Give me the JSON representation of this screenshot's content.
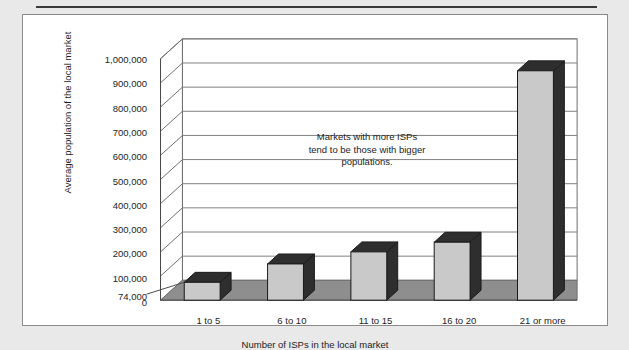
{
  "chart_data": {
    "type": "bar",
    "title": "",
    "xlabel": "Number of ISPs in the local market",
    "ylabel": "Average population of the local market",
    "categories": [
      "1 to 5",
      "6 to 10",
      "11 to 15",
      "16 to 20",
      "21 or more"
    ],
    "values": [
      74000,
      150000,
      200000,
      240000,
      950000
    ],
    "ylim": [
      0,
      1000000
    ],
    "ytick_labels": [
      "0",
      "74,000",
      "100,000",
      "200,000",
      "300,000",
      "400,000",
      "500,000",
      "600,000",
      "700,000",
      "800,000",
      "900,000",
      "1,000,000"
    ],
    "ytick_values": [
      0,
      74000,
      100000,
      200000,
      300000,
      400000,
      500000,
      600000,
      700000,
      800000,
      900000,
      1000000
    ],
    "grid": true,
    "legend": "none",
    "annotations": [
      {
        "text": "Markets with more ISPs tend to be those with bigger populations.",
        "line1": "Markets with more ISPs",
        "line2": "tend to be those with bigger",
        "line3": "populations."
      }
    ],
    "style": {
      "bar_front_color": "#c9c9c9",
      "bar_side_color": "#2e2e2e",
      "bar_top_color": "#2e2e2e",
      "floor_color": "#8e8e8e",
      "wall_color": "#ffffff",
      "gridline_color": "#808080",
      "panel_background": "#ffffff",
      "page_background": "#e9e9e9",
      "text_color": "#1d1d1d"
    }
  }
}
